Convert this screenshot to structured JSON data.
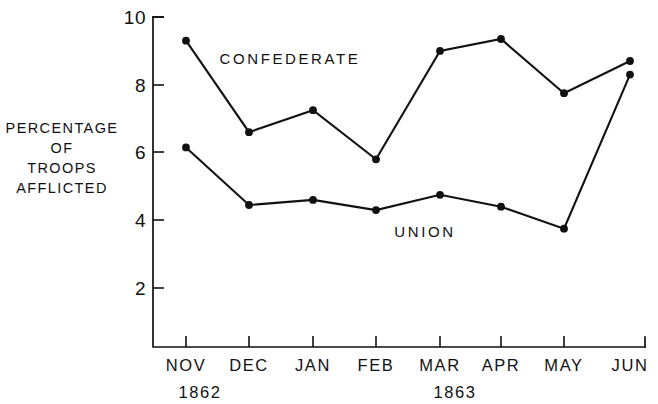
{
  "chart_data": {
    "type": "line",
    "title": "",
    "subtitle": "",
    "xlabel": "",
    "ylabel": "PERCENTAGE OF TROOPS AFFLICTED",
    "categories": [
      "NOV",
      "DEC",
      "JAN",
      "FEB",
      "MAR",
      "APR",
      "MAY",
      "JUN"
    ],
    "x_group_labels": [
      "1862",
      "1863"
    ],
    "ylim": [
      1,
      10
    ],
    "yticks": [
      2,
      4,
      6,
      8,
      10
    ],
    "ytick_labels": [
      "2",
      "4",
      "6",
      "8",
      "10"
    ],
    "grid": false,
    "legend": "inline-annotations",
    "series": [
      {
        "name": "CONFEDERATE",
        "values": [
          9.3,
          6.6,
          7.25,
          5.8,
          9.0,
          9.35,
          7.75,
          8.7
        ]
      },
      {
        "name": "UNION",
        "values": [
          6.15,
          4.45,
          4.6,
          4.3,
          4.75,
          4.4,
          3.75,
          8.3
        ]
      }
    ],
    "annotations": [
      {
        "text": "CONFEDERATE",
        "series": "CONFEDERATE"
      },
      {
        "text": "UNION",
        "series": "UNION"
      }
    ]
  },
  "axis": {
    "y_title_lines": [
      "PERCENTAGE",
      "OF",
      "TROOPS",
      "AFFLICTED"
    ],
    "y_tick_labels": [
      "10",
      "8",
      "6",
      "4",
      "2"
    ],
    "x_tick_labels": [
      "NOV",
      "DEC",
      "JAN",
      "FEB",
      "MAR",
      "APR",
      "MAY",
      "JUN"
    ],
    "year_labels": [
      "1862",
      "1863"
    ]
  },
  "colors": {
    "ink": "#111111",
    "background": "#ffffff"
  }
}
